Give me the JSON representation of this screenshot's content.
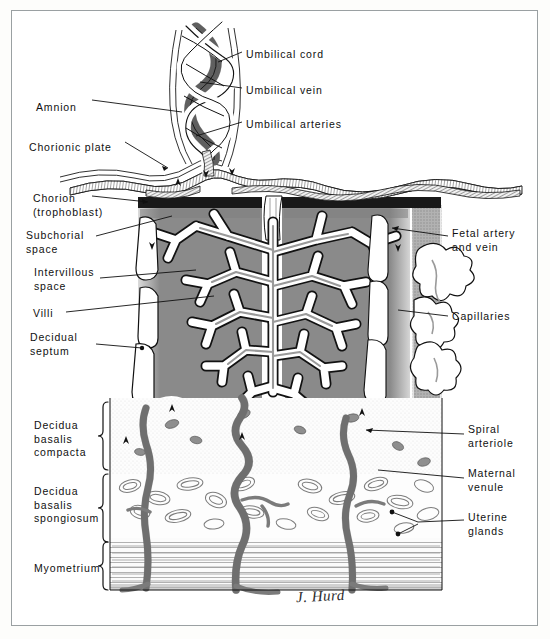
{
  "figure": {
    "signature": "J. Hurd",
    "border_color": "#9aa0a2",
    "background_color": "#ffffff"
  },
  "colors": {
    "intervillous_space": "#8a8a8a",
    "chorion_band": "#1b1b1b",
    "vessel_gray": "#8c8c8c",
    "vessel_dark": "#6e6e6e",
    "ink": "#101010",
    "stipple": "#b9b9b9"
  },
  "labels_left": [
    {
      "id": "amnion",
      "text": "Amnion",
      "x": 36,
      "y": 101
    },
    {
      "id": "chorionic-plate",
      "text": "Chorionic plate",
      "x": 29,
      "y": 141
    },
    {
      "id": "chorion",
      "text": "Chorion\n(trophoblast)",
      "x": 33,
      "y": 197
    },
    {
      "id": "subchorial-space",
      "text": "Subchorial\nspace",
      "x": 26,
      "y": 234
    },
    {
      "id": "intervillous-space",
      "text": "Intervillous\nspace",
      "x": 34,
      "y": 271
    },
    {
      "id": "villi",
      "text": "Villi",
      "x": 33,
      "y": 312
    },
    {
      "id": "decidual-septum",
      "text": "Decidual\nseptum",
      "x": 30,
      "y": 336
    },
    {
      "id": "decidua-basalis-compacta",
      "text": "Decidua\nbasalis\ncompacta",
      "x": 34,
      "y": 424
    },
    {
      "id": "decidua-basalis-spongiosum",
      "text": "Decidua\nbasalis\nspongiosum",
      "x": 34,
      "y": 490
    },
    {
      "id": "myometrium",
      "text": "Myometrium",
      "x": 34,
      "y": 562
    }
  ],
  "labels_right": [
    {
      "id": "umbilical-cord",
      "text": "Umbilical cord",
      "x": 246,
      "y": 54
    },
    {
      "id": "umbilical-vein",
      "text": "Umbilical vein",
      "x": 246,
      "y": 90
    },
    {
      "id": "umbilical-arteries",
      "text": "Umbilical arteries",
      "x": 246,
      "y": 124
    },
    {
      "id": "fetal-artery-and-vein",
      "text": "Fetal artery\nand vein",
      "x": 452,
      "y": 232
    },
    {
      "id": "capillaries",
      "text": "Capillaries",
      "x": 452,
      "y": 313
    },
    {
      "id": "spiral-arteriole",
      "text": "Spiral\narteriole",
      "x": 468,
      "y": 428
    },
    {
      "id": "maternal-venule",
      "text": "Maternal\nvenule",
      "x": 468,
      "y": 472
    },
    {
      "id": "uterine-glands",
      "text": "Uterine\nglands",
      "x": 468,
      "y": 516
    }
  ],
  "anatomy": {
    "layers": [
      {
        "name": "umbilical-cord",
        "description": "helically twisted cord with vein and two arteries"
      },
      {
        "name": "amnion",
        "description": "thin membrane sheet over chorionic plate"
      },
      {
        "name": "chorionic-plate",
        "description": "plate carrying fetal vessels"
      },
      {
        "name": "chorion-trophoblast",
        "description": "dark band beneath chorionic plate"
      },
      {
        "name": "subchorial-space",
        "description": "space just under chorionic plate"
      },
      {
        "name": "intervillous-space",
        "description": "gray maternal blood space"
      },
      {
        "name": "villi",
        "description": "branching villous tree"
      },
      {
        "name": "decidual-septum",
        "description": "white vertical partition"
      },
      {
        "name": "decidua-basalis-compacta",
        "description": "pale layer with spiral arterioles"
      },
      {
        "name": "decidua-basalis-spongiosum",
        "description": "layer with oval uterine glands"
      },
      {
        "name": "myometrium",
        "description": "striated muscle layer at base"
      }
    ],
    "bracket_rows": [
      {
        "id": "bracket-compacta",
        "top": 410,
        "bottom": 470
      },
      {
        "id": "bracket-spongiosum",
        "top": 472,
        "bottom": 538
      },
      {
        "id": "bracket-myometrium",
        "top": 541,
        "bottom": 588
      }
    ]
  }
}
